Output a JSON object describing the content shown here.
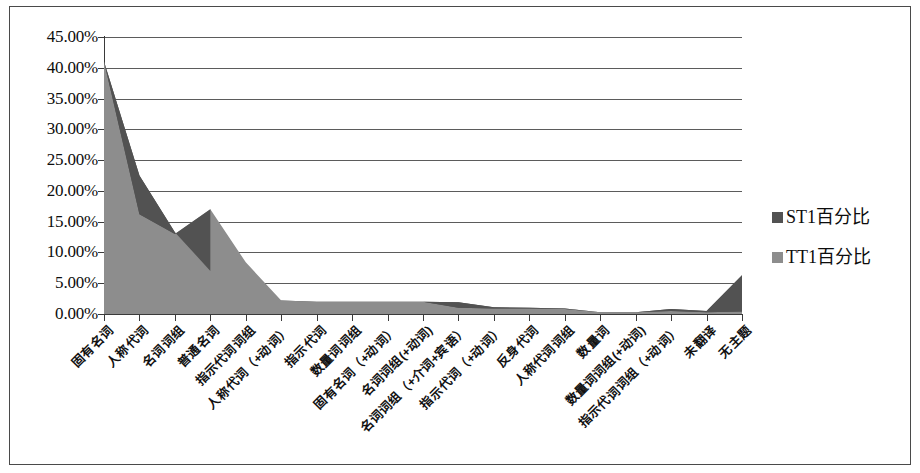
{
  "chart_data": {
    "type": "area",
    "title": "",
    "subtitle": "",
    "xlabel": "",
    "ylabel": "",
    "ylim": [
      0,
      45
    ],
    "ytick_labels": [
      "45.00%",
      "40.00%",
      "35.00%",
      "30.00%",
      "25.00%",
      "20.00%",
      "15.00%",
      "10.00%",
      "5.00%",
      "0.00%"
    ],
    "ytick_values": [
      45,
      40,
      35,
      30,
      25,
      20,
      15,
      10,
      5,
      0
    ],
    "grid": true,
    "legend_position": "right",
    "categories": [
      "固有名词",
      "人称代词",
      "名词词组",
      "普通名词",
      "指示代词词组",
      "人称代词（+动词）",
      "指示代词",
      "数量词词组",
      "固有名词（+动词）",
      "名词词组(+动词)",
      "名词词组（+介词+宾语）",
      "指示代词（+动词）",
      "反身代词",
      "人称代词词组",
      "数量词",
      "数量词词组(+动词)",
      "指示代词词组（+动词）",
      "未翻译",
      "无主题"
    ],
    "series": [
      {
        "name": "ST1百分比",
        "color": "#525252",
        "values": [
          41.0,
          22.5,
          13.3,
          7.0,
          2.6,
          2.2,
          2.0,
          2.0,
          2.0,
          2.0,
          1.9,
          1.1,
          1.0,
          0.9,
          0.3,
          0.3,
          0.8,
          0.5,
          6.3
        ]
      },
      {
        "name": "TT1百分比",
        "color": "#8d8d8d",
        "values": [
          41.0,
          16.2,
          13.0,
          17.0,
          8.4,
          2.2,
          2.0,
          2.0,
          2.0,
          2.0,
          1.0,
          0.9,
          0.9,
          0.8,
          0.3,
          0.3,
          0.5,
          0.3,
          0.4
        ]
      }
    ]
  },
  "legend": {
    "items": [
      {
        "label": "ST1百分比",
        "color": "#525252"
      },
      {
        "label": "TT1百分比",
        "color": "#8d8d8d"
      }
    ]
  }
}
